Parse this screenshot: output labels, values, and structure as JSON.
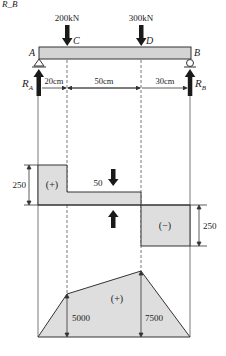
{
  "top_caption": "R_B",
  "beam": {
    "label_A": "A",
    "label_B": "B",
    "label_C": "C",
    "label_D": "D",
    "load_C": "200kN",
    "load_D": "300kN",
    "reaction_A": "R",
    "reaction_A_sub": "A",
    "reaction_B": "R",
    "reaction_B_sub": "B",
    "dim_AC": "20cm",
    "dim_CD": "50cm",
    "dim_DB": "30cm"
  },
  "shear": {
    "left_value": "250",
    "left_sign": "(+)",
    "mid_value": "50",
    "right_value": "250",
    "right_sign": "(−)"
  },
  "moment": {
    "sign": "(+)",
    "value_C": "5000",
    "value_D": "7500"
  },
  "colors": {
    "fill": "#dedede",
    "stroke": "#333333",
    "arrow": "#1a1a1a"
  }
}
